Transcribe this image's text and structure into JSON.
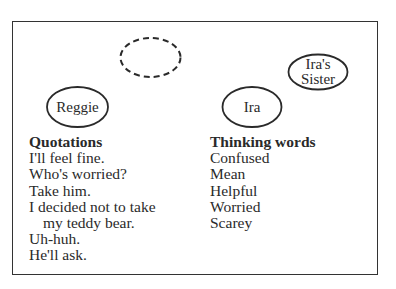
{
  "diagram": {
    "bubbles": {
      "empty": "",
      "reggie": "Reggie",
      "ira": "Ira",
      "sister_line1": "Ira's",
      "sister_line2": "Sister"
    },
    "quotations": {
      "heading": "Quotations",
      "items": [
        "I'll feel fine.",
        "Who's worried?",
        "Take him.",
        "I decided not to take",
        "my teddy bear.",
        "Uh-huh.",
        "He'll ask."
      ]
    },
    "thinking_words": {
      "heading": "Thinking words",
      "items": [
        "Confused",
        "Mean",
        "Helpful",
        "Worried",
        "Scarey"
      ]
    }
  }
}
